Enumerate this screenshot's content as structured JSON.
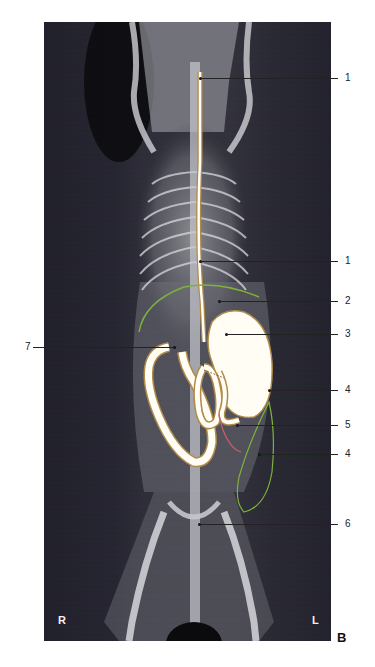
{
  "figure": {
    "panel_letter": "B",
    "orientation": {
      "right": "R",
      "left": "L"
    },
    "colors": {
      "contrast_outline": "#b08a4a",
      "liver_outline": "#7fb23a",
      "spleen_outline": "#7fb23a",
      "red_outline": "#d06070",
      "contrast_fill": "#fffdf4"
    },
    "labels": [
      {
        "id": "label-1-top",
        "text": "1",
        "target": "esophagus (cervical)"
      },
      {
        "id": "label-1-mid",
        "text": "1",
        "target": "esophagus (thoracic)"
      },
      {
        "id": "label-2",
        "text": "2"
      },
      {
        "id": "label-3",
        "text": "3"
      },
      {
        "id": "label-4-top",
        "text": "4"
      },
      {
        "id": "label-5",
        "text": "5"
      },
      {
        "id": "label-4-bottom",
        "text": "4"
      },
      {
        "id": "label-6",
        "text": "6"
      },
      {
        "id": "label-7",
        "text": "7"
      }
    ]
  }
}
